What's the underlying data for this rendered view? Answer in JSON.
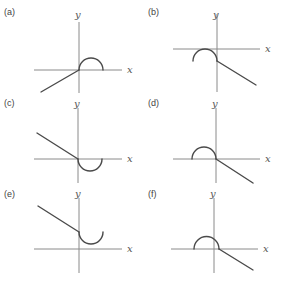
{
  "figure": {
    "axis_labels": {
      "x": "x",
      "y": "y"
    },
    "colors": {
      "axis": "#8a8a8a",
      "curve": "#4a4a4a",
      "text": "#444444"
    },
    "panels": [
      {
        "id": "a",
        "label": "(a)",
        "line": "from lower-left rising to origin",
        "semicircle": "upper half, right of origin, starting at origin"
      },
      {
        "id": "b",
        "label": "(b)",
        "line": "from below origin descending to lower-right",
        "semicircle": "upper half, left of y-axis, below x-axis, ending at line start"
      },
      {
        "id": "c",
        "label": "(c)",
        "line": "from upper-left descending to origin",
        "semicircle": "lower half, right of origin, starting at origin"
      },
      {
        "id": "d",
        "label": "(d)",
        "line": "from origin descending to lower-right",
        "semicircle": "upper half, left of origin, ending at origin"
      },
      {
        "id": "e",
        "label": "(e)",
        "line": "from upper-left descending to point on positive y-axis",
        "semicircle": "lower half, right of y-axis, above x-axis"
      },
      {
        "id": "f",
        "label": "(f)",
        "line": "from just right of origin descending to lower-right",
        "semicircle": "upper half, straddling y-axis, ending right of origin"
      }
    ]
  }
}
